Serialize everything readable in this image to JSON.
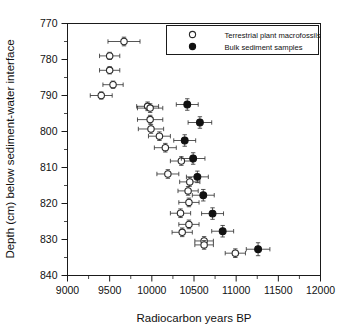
{
  "chart_data": {
    "type": "scatter",
    "title": "",
    "xlabel": "Radiocarbon years BP",
    "ylabel": "Depth (cm) below sediment-water interface",
    "xlim": [
      9000,
      12000
    ],
    "ylim": [
      770,
      840
    ],
    "y_inverted": true,
    "grid": false,
    "legend_position": "top-right",
    "x_ticks": [
      9000,
      9500,
      10000,
      10500,
      11000,
      11500,
      12000
    ],
    "x_tick_labels": [
      "9000",
      "9500",
      "10000",
      "10500",
      "11000",
      "11500",
      "12000"
    ],
    "x_minor_step": 250,
    "y_ticks": [
      770,
      780,
      790,
      800,
      810,
      820,
      830,
      840
    ],
    "y_tick_labels": [
      "770",
      "780",
      "790",
      "800",
      "810",
      "820",
      "830",
      "840"
    ],
    "y_minor_step": 5,
    "error_bars": "horizontal and vertical",
    "series": [
      {
        "name": "Terrestrial plant macrofossils",
        "marker": "open-circle",
        "color": "#ffffff",
        "edge_color": "#2b2b2b",
        "points": [
          {
            "x": 9670,
            "y": 775.0,
            "xerr": 190,
            "yerr": 1.2
          },
          {
            "x": 9500,
            "y": 779.0,
            "xerr": 120,
            "yerr": 1.0
          },
          {
            "x": 9500,
            "y": 783.0,
            "xerr": 120,
            "yerr": 1.0
          },
          {
            "x": 9540,
            "y": 787.0,
            "xerr": 120,
            "yerr": 1.0
          },
          {
            "x": 9400,
            "y": 790.0,
            "xerr": 130,
            "yerr": 1.0
          },
          {
            "x": 9950,
            "y": 793.0,
            "xerr": 130,
            "yerr": 1.2
          },
          {
            "x": 9980,
            "y": 793.5,
            "xerr": 150,
            "yerr": 1.2
          },
          {
            "x": 9980,
            "y": 796.7,
            "xerr": 150,
            "yerr": 1.2
          },
          {
            "x": 9990,
            "y": 799.3,
            "xerr": 150,
            "yerr": 1.2
          },
          {
            "x": 10090,
            "y": 801.3,
            "xerr": 130,
            "yerr": 1.2
          },
          {
            "x": 10160,
            "y": 804.5,
            "xerr": 130,
            "yerr": 1.2
          },
          {
            "x": 10190,
            "y": 811.8,
            "xerr": 130,
            "yerr": 1.2
          },
          {
            "x": 10350,
            "y": 808.2,
            "xerr": 130,
            "yerr": 1.2
          },
          {
            "x": 10450,
            "y": 814.0,
            "xerr": 120,
            "yerr": 1.2
          },
          {
            "x": 10430,
            "y": 816.5,
            "xerr": 120,
            "yerr": 1.2
          },
          {
            "x": 10440,
            "y": 819.7,
            "xerr": 120,
            "yerr": 1.2
          },
          {
            "x": 10340,
            "y": 822.7,
            "xerr": 120,
            "yerr": 1.2
          },
          {
            "x": 10440,
            "y": 825.8,
            "xerr": 120,
            "yerr": 1.2
          },
          {
            "x": 10360,
            "y": 828.0,
            "xerr": 120,
            "yerr": 1.2
          },
          {
            "x": 10620,
            "y": 830.4,
            "xerr": 110,
            "yerr": 1.2
          },
          {
            "x": 10620,
            "y": 831.5,
            "xerr": 110,
            "yerr": 1.2
          },
          {
            "x": 10990,
            "y": 833.8,
            "xerr": 120,
            "yerr": 1.2
          }
        ]
      },
      {
        "name": "Bulk sediment samples",
        "marker": "filled-circle",
        "color": "#111111",
        "edge_color": "#111111",
        "points": [
          {
            "x": 10420,
            "y": 792.5,
            "xerr": 130,
            "yerr": 1.6
          },
          {
            "x": 10570,
            "y": 797.5,
            "xerr": 140,
            "yerr": 1.6
          },
          {
            "x": 10390,
            "y": 802.5,
            "xerr": 130,
            "yerr": 1.6
          },
          {
            "x": 10490,
            "y": 807.5,
            "xerr": 140,
            "yerr": 1.6
          },
          {
            "x": 10540,
            "y": 812.6,
            "xerr": 130,
            "yerr": 1.6
          },
          {
            "x": 10610,
            "y": 817.7,
            "xerr": 130,
            "yerr": 1.6
          },
          {
            "x": 10720,
            "y": 822.8,
            "xerr": 130,
            "yerr": 1.6
          },
          {
            "x": 10840,
            "y": 827.7,
            "xerr": 130,
            "yerr": 1.6
          },
          {
            "x": 11260,
            "y": 832.7,
            "xerr": 140,
            "yerr": 1.8
          }
        ]
      }
    ]
  },
  "legend": {
    "entries": [
      {
        "label": "Terrestrial plant macrofossils",
        "marker": "open-circle"
      },
      {
        "label": "Bulk sediment samples",
        "marker": "filled-circle"
      }
    ]
  },
  "axes": {
    "x_title": "Radiocarbon years BP",
    "y_title": "Depth (cm) below sediment-water interface"
  }
}
